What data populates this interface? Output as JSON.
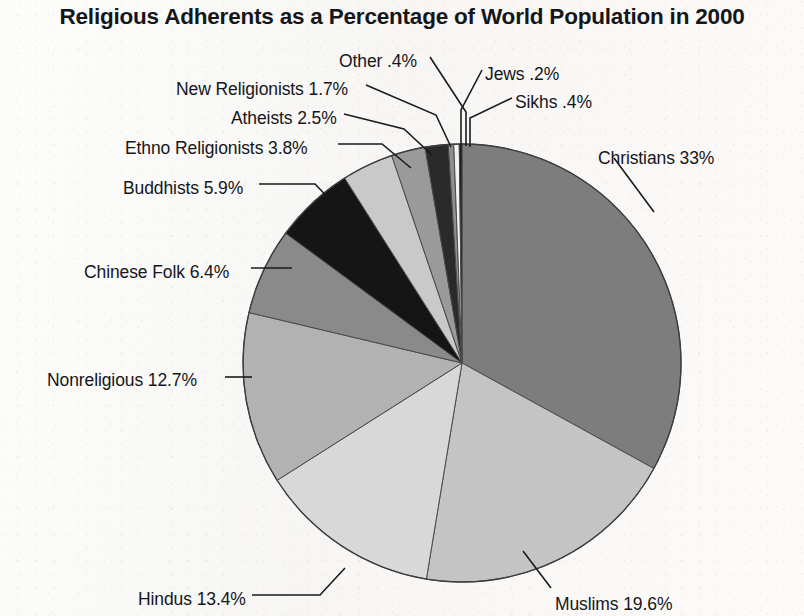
{
  "chart": {
    "title": "Religious Adherents as a Percentage of World Population in 2000"
  },
  "chart_data": {
    "type": "pie",
    "title": "Religious Adherents as a Percentage of World Population in 2000",
    "xlabel": "",
    "ylabel": "",
    "unit": "percent",
    "legend_position": "callout-labels",
    "grid": false,
    "categories": [
      "Christians",
      "Muslims",
      "Hindus",
      "Nonreligious",
      "Chinese Folk",
      "Buddhists",
      "Ethno Religionists",
      "Atheists",
      "New Religionists",
      "Other",
      "Sikhs",
      "Jews"
    ],
    "values": [
      33,
      19.6,
      13.4,
      12.7,
      6.4,
      5.9,
      3.8,
      2.5,
      1.7,
      0.4,
      0.4,
      0.2
    ],
    "labels": [
      "Christians 33%",
      "Muslims 19.6%",
      "Hindus 13.4%",
      "Nonreligious 12.7%",
      "Chinese Folk 6.4%",
      "Buddhists 5.9%",
      "Ethno Religionists 3.8%",
      "Atheists 2.5%",
      "New Religionists 1.7%",
      "Other .4%",
      "Sikhs .4%",
      "Jews .2%"
    ],
    "value_texts": [
      "33%",
      "19.6%",
      "13.4%",
      "12.7%",
      "6.4%",
      "5.9%",
      "3.8%",
      "2.5%",
      "1.7%",
      ".4%",
      ".4%",
      ".2%"
    ],
    "colors": [
      "#7d7d7d",
      "#c4c4c4",
      "#d8d8d8",
      "#b2b2b2",
      "#8a8a8a",
      "#151515",
      "#c9c9c9",
      "#9a9a9a",
      "#2a2a2a",
      "#8f8f8f",
      "#f2f2f2",
      "#1a1a1a"
    ],
    "start_angle_deg": -90,
    "direction": "clockwise",
    "slices": [
      {
        "name": "Christians",
        "value": 33,
        "label": "Christians 33%",
        "color": "#7d7d7d"
      },
      {
        "name": "Muslims",
        "value": 19.6,
        "label": "Muslims 19.6%",
        "color": "#c4c4c4"
      },
      {
        "name": "Hindus",
        "value": 13.4,
        "label": "Hindus 13.4%",
        "color": "#d8d8d8"
      },
      {
        "name": "Nonreligious",
        "value": 12.7,
        "label": "Nonreligious 12.7%",
        "color": "#b2b2b2"
      },
      {
        "name": "Chinese Folk",
        "value": 6.4,
        "label": "Chinese Folk 6.4%",
        "color": "#8a8a8a"
      },
      {
        "name": "Buddhists",
        "value": 5.9,
        "label": "Buddhists 5.9%",
        "color": "#151515"
      },
      {
        "name": "Ethno Religionists",
        "value": 3.8,
        "label": "Ethno Religionists 3.8%",
        "color": "#c9c9c9"
      },
      {
        "name": "Atheists",
        "value": 2.5,
        "label": "Atheists 2.5%",
        "color": "#9a9a9a"
      },
      {
        "name": "New Religionists",
        "value": 1.7,
        "label": "New Religionists 1.7%",
        "color": "#2a2a2a"
      },
      {
        "name": "Other",
        "value": 0.4,
        "label": "Other .4%",
        "color": "#8f8f8f"
      },
      {
        "name": "Sikhs",
        "value": 0.4,
        "label": "Sikhs .4%",
        "color": "#f2f2f2"
      },
      {
        "name": "Jews",
        "value": 0.2,
        "label": "Jews .2%",
        "color": "#1a1a1a"
      }
    ],
    "geometry": {
      "center_x": 462,
      "center_y": 363,
      "radius": 219
    }
  },
  "labels_layout": [
    {
      "key": "other",
      "text": "Other .4%",
      "x": 339,
      "y": 51,
      "align": "left"
    },
    {
      "key": "jews",
      "text": "Jews .2%",
      "x": 485,
      "y": 64,
      "align": "left"
    },
    {
      "key": "new-religionists",
      "text": "New Religionists 1.7%",
      "x": 176,
      "y": 79,
      "align": "left"
    },
    {
      "key": "sikhs",
      "text": "Sikhs .4%",
      "x": 515,
      "y": 92,
      "align": "left"
    },
    {
      "key": "atheists",
      "text": "Atheists 2.5%",
      "x": 231,
      "y": 108,
      "align": "left"
    },
    {
      "key": "ethno-religionists",
      "text": "Ethno Religionists 3.8%",
      "x": 125,
      "y": 138,
      "align": "left"
    },
    {
      "key": "christians",
      "text": "Christians 33%",
      "x": 598,
      "y": 148,
      "align": "left"
    },
    {
      "key": "buddhists",
      "text": "Buddhists 5.9%",
      "x": 123,
      "y": 178,
      "align": "left"
    },
    {
      "key": "chinese-folk",
      "text": "Chinese Folk 6.4%",
      "x": 84,
      "y": 262,
      "align": "left"
    },
    {
      "key": "nonreligious",
      "text": "Nonreligious 12.7%",
      "x": 47,
      "y": 370,
      "align": "left"
    },
    {
      "key": "hindus",
      "text": "Hindus 13.4%",
      "x": 138,
      "y": 589,
      "align": "left"
    },
    {
      "key": "muslims",
      "text": "Muslims 19.6%",
      "x": 555,
      "y": 594,
      "align": "left"
    }
  ]
}
